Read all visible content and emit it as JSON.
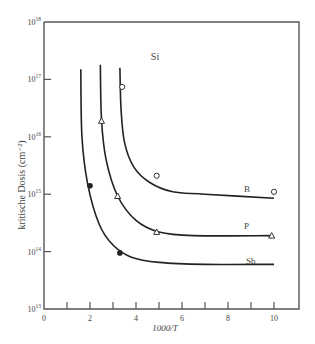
{
  "chart_data": {
    "type": "line",
    "title": "",
    "annotation": "Si",
    "xlabel": "1000/T",
    "ylabel": "kritische Dosis (cm⁻²)",
    "xlim": [
      0,
      11
    ],
    "ylim_log10": [
      13,
      18
    ],
    "yscale": "log",
    "grid": false,
    "x_ticks": [
      0,
      2,
      4,
      6,
      8,
      10
    ],
    "x_minor_ticks": [
      1,
      3,
      5,
      7,
      9
    ],
    "y_ticks": [
      "10^13",
      "10^14",
      "10^15",
      "10^16",
      "10^17",
      "10^18"
    ],
    "series": [
      {
        "name": "B",
        "marker": "open-circle",
        "points": [
          {
            "x": 3.4,
            "y": 7.4e+16
          },
          {
            "x": 4.9,
            "y": 2100000000000000.0
          },
          {
            "x": 10.0,
            "y": 1100000000000000.0
          }
        ],
        "curve": [
          [
            3.3,
            1.6e+17
          ],
          [
            3.35,
            3e+16
          ],
          [
            3.5,
            8000000000000000.0
          ],
          [
            3.9,
            3000000000000000.0
          ],
          [
            4.6,
            1600000000000000.0
          ],
          [
            5.6,
            1100000000000000.0
          ],
          [
            7,
            1000000000000000.0
          ],
          [
            10,
            850000000000000.0
          ]
        ]
      },
      {
        "name": "P",
        "marker": "open-triangle",
        "points": [
          {
            "x": 2.5,
            "y": 1.9e+16
          },
          {
            "x": 3.2,
            "y": 930000000000000.0
          },
          {
            "x": 4.9,
            "y": 220000000000000.0
          },
          {
            "x": 9.9,
            "y": 190000000000000.0
          }
        ],
        "curve": [
          [
            2.45,
            1.8e+17
          ],
          [
            2.5,
            2e+16
          ],
          [
            2.7,
            4000000000000000.0
          ],
          [
            3.2,
            930000000000000.0
          ],
          [
            4.0,
            350000000000000.0
          ],
          [
            5.0,
            220000000000000.0
          ],
          [
            6.5,
            190000000000000.0
          ],
          [
            9.9,
            190000000000000.0
          ]
        ]
      },
      {
        "name": "Sb",
        "marker": "filled-circle",
        "points": [
          {
            "x": 2.0,
            "y": 1400000000000000.0
          },
          {
            "x": 3.3,
            "y": 95000000000000.0
          }
        ],
        "curve": [
          [
            1.6,
            1.5e+17
          ],
          [
            1.65,
            1e+16
          ],
          [
            1.9,
            1500000000000000.0
          ],
          [
            2.4,
            300000000000000.0
          ],
          [
            3.0,
            130000000000000.0
          ],
          [
            3.8,
            80000000000000.0
          ],
          [
            5,
            65000000000000.0
          ],
          [
            7,
            60000000000000.0
          ],
          [
            10,
            60000000000000.0
          ]
        ]
      }
    ]
  }
}
